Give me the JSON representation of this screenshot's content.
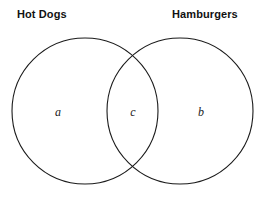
{
  "diagram": {
    "type": "venn-diagram",
    "sets": [
      {
        "id": "left",
        "label": "Hot Dogs",
        "region_letter": "a",
        "circle": {
          "cx": 85,
          "cy": 111,
          "r": 73
        }
      },
      {
        "id": "right",
        "label": "Hamburgers",
        "region_letter": "b",
        "circle": {
          "cx": 180,
          "cy": 111,
          "r": 73
        }
      }
    ],
    "intersection": {
      "id": "both",
      "region_letter": "c"
    },
    "colors": {
      "background": "#ffffff",
      "stroke": "#1b1b1b",
      "label_text": "#111111",
      "letter_text": "#1b1b1b"
    }
  }
}
